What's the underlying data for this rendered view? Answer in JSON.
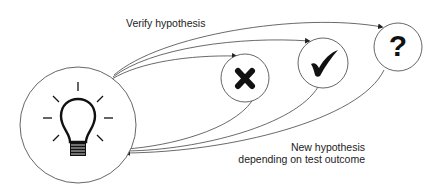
{
  "labels": {
    "verify": "Verify hypothesis",
    "new_line1": "New hypothesis",
    "new_line2": "depending on test outcome"
  },
  "nodes": [
    {
      "id": "idea",
      "icon": "lightbulb-icon"
    },
    {
      "id": "rejected",
      "icon": "cross-icon"
    },
    {
      "id": "confirmed",
      "icon": "checkmark-icon"
    },
    {
      "id": "inconclusive",
      "icon": "question-mark-icon",
      "glyph": "?"
    }
  ],
  "colors": {
    "stroke": "#333333",
    "fill": "#ffffff",
    "symbol": "#111111"
  }
}
